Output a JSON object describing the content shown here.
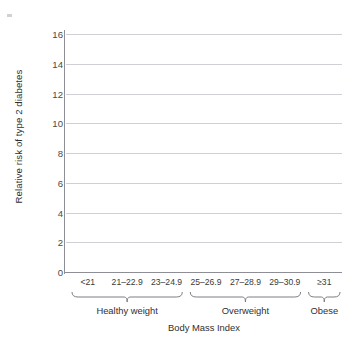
{
  "chart_data": {
    "type": "bar",
    "title": "",
    "subtitle": "",
    "xlabel": "Body Mass Index",
    "ylabel": "Relative risk of type 2 diabetes",
    "categories": [
      "<21",
      "21–22.9",
      "23–24.9",
      "25–26.9",
      "27–28.9",
      "29–30.9",
      "≥31"
    ],
    "values": [
      1.4,
      1.5,
      3.2,
      6.7,
      8.9,
      11.3,
      15.6
    ],
    "ylim": [
      0,
      16
    ],
    "xlim_note": "categorical, 7 bars",
    "yticks": [
      0,
      2,
      4,
      6,
      8,
      10,
      12,
      14,
      16
    ],
    "ytick_labels": [
      "0",
      "2",
      "4",
      "6",
      "8",
      "10",
      "12",
      "14",
      "16"
    ],
    "grid": true,
    "grid_axis": "y",
    "legend": false,
    "legend_position": "none",
    "series": [
      {
        "name": "Relative risk of type 2 diabetes",
        "values": [
          1.4,
          1.5,
          3.2,
          6.7,
          8.9,
          11.3,
          15.6
        ],
        "color": "#97365d"
      }
    ],
    "groups": [
      {
        "label": "Healthy weight",
        "start_index": 0,
        "end_index": 2
      },
      {
        "label": "Overweight",
        "start_index": 3,
        "end_index": 5
      },
      {
        "label": "Obese",
        "start_index": 6,
        "end_index": 6
      }
    ],
    "colors": {
      "bar_fill": "#97365d",
      "bar_highlight": "#bb7291",
      "bar_shadow": "#7f2148",
      "gridline": "#cfd0d6",
      "axis": "#8e8f96",
      "text": "#2f2f2f",
      "background": "#ffffff"
    }
  }
}
